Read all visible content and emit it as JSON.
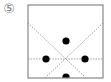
{
  "figure": {
    "label": "⑤",
    "box": {
      "x": 28,
      "y": 5,
      "width": 75,
      "height": 73,
      "stroke": "#888888"
    },
    "lines": [
      {
        "name": "horizontal-dashed-line",
        "x1": 28,
        "y1": 59,
        "x2": 103,
        "y2": 59,
        "dashed": true
      },
      {
        "name": "diagonal-left-to-right",
        "x1": 28,
        "y1": 23,
        "x2": 86,
        "y2": 78,
        "dashed": true
      },
      {
        "name": "diagonal-right-to-left",
        "x1": 103,
        "y1": 23,
        "x2": 45,
        "y2": 78,
        "dashed": true
      }
    ],
    "dots": [
      {
        "name": "dot-top",
        "cx": 66,
        "cy": 41
      },
      {
        "name": "dot-left",
        "cx": 46,
        "cy": 59
      },
      {
        "name": "dot-right",
        "cx": 85,
        "cy": 59
      },
      {
        "name": "dot-bottom",
        "cx": 66,
        "cy": 77
      }
    ],
    "dot_radius": 3.6,
    "dot_color": "#000000",
    "line_color": "#999999"
  }
}
